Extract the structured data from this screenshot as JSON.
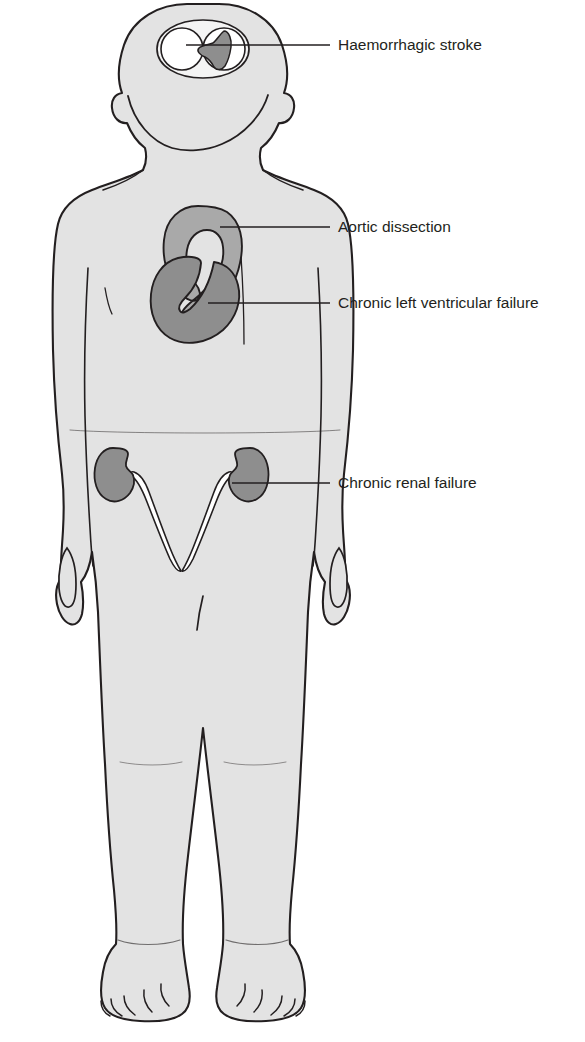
{
  "colors": {
    "background": "#ffffff",
    "body_fill": "#e3e3e3",
    "body_outline": "#231f20",
    "organ_light": "#a9a9a9",
    "organ_dark": "#8e8e8e",
    "brain_fill": "#f4f4f4",
    "haemorrhage_fill": "#8e8e8e",
    "ureter_fill": "#ffffff",
    "leader_line": "#231f20",
    "label_text": "#231f20"
  },
  "labels": [
    {
      "id": "haemorrhagic-stroke",
      "text": "Haemorrhagic stroke",
      "organ": "brain",
      "text_x": 338,
      "text_y": 45,
      "leader_start_x": 186,
      "leader_start_y": 45,
      "leader_end_x": 330,
      "leader_end_y": 45
    },
    {
      "id": "aortic-dissection",
      "text": "Aortic dissection",
      "organ": "aorta",
      "text_x": 338,
      "text_y": 227,
      "leader_start_x": 220,
      "leader_start_y": 227,
      "leader_end_x": 330,
      "leader_end_y": 227
    },
    {
      "id": "chronic-left-ventricular-failure",
      "text": "Chronic left ventricular failure",
      "organ": "heart",
      "text_x": 338,
      "text_y": 303,
      "leader_start_x": 208,
      "leader_start_y": 303,
      "leader_end_x": 330,
      "leader_end_y": 303
    },
    {
      "id": "chronic-renal-failure",
      "text": "Chronic renal failure",
      "organ": "right-kidney",
      "text_x": 338,
      "text_y": 483,
      "leader_start_x": 232,
      "leader_start_y": 483,
      "leader_end_x": 330,
      "leader_end_y": 483
    }
  ],
  "organs": [
    {
      "id": "brain",
      "name": "brain",
      "shade": "light"
    },
    {
      "id": "haemorrhage",
      "name": "intracerebral-bleed",
      "shade": "dark"
    },
    {
      "id": "aorta",
      "name": "aortic-arch",
      "shade": "light"
    },
    {
      "id": "heart",
      "name": "heart",
      "shade": "dark"
    },
    {
      "id": "left-kidney",
      "name": "kidney-left",
      "shade": "dark"
    },
    {
      "id": "right-kidney",
      "name": "kidney-right",
      "shade": "dark"
    },
    {
      "id": "left-ureter",
      "name": "ureter-left",
      "shade": "white"
    },
    {
      "id": "right-ureter",
      "name": "ureter-right",
      "shade": "white"
    }
  ]
}
